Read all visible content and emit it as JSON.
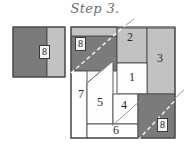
{
  "title": "Step 3.",
  "colors": {
    "dark_gray": "#7b7b7b",
    "light_gray": "#c2c2c2",
    "white": "#fdfdfd",
    "outline": "#4a4a4a",
    "title_text": "#6d6d6d",
    "label_text": "#2a2a2a"
  },
  "left_rectangle": {
    "name": "source-rectangle",
    "x": 13,
    "y": 27,
    "w": 52,
    "h": 50,
    "dark_part": {
      "x": 13,
      "y": 27,
      "w": 34,
      "h": 50,
      "fill": "#7b7b7b"
    },
    "light_part": {
      "x": 47,
      "y": 27,
      "w": 18,
      "h": 50,
      "fill": "#c2c2c2"
    },
    "label": "8",
    "label_x": 41,
    "label_y": 45
  },
  "main_square": {
    "name": "target-square",
    "x": 71,
    "y": 27,
    "w": 104,
    "h": 111
  },
  "pieces": [
    {
      "id": "piece-1",
      "label": "1",
      "fill": "#fdfdfd",
      "x": 117,
      "y": 63,
      "w": 30,
      "h": 31,
      "label_x": 128,
      "label_y": 72
    },
    {
      "id": "piece-2",
      "label": "2",
      "fill": "#c2c2c2",
      "x": 117,
      "y": 28,
      "w": 30,
      "h": 35,
      "label_x": 128,
      "label_y": 37
    },
    {
      "id": "piece-3",
      "label": "3",
      "fill": "#c2c2c2",
      "x": 147,
      "y": 40,
      "w": 28,
      "h": 54,
      "label_x": 158,
      "label_y": 58
    },
    {
      "id": "piece-4",
      "label": "4",
      "fill": "#fdfdfd",
      "x": 113,
      "y": 94,
      "w": 25,
      "h": 30,
      "label_x": 121,
      "label_y": 101
    },
    {
      "id": "piece-5",
      "label": "5",
      "fill": "#fdfdfd",
      "x": 87,
      "y": 83,
      "w": 26,
      "h": 41,
      "label_x": 96,
      "label_y": 98
    },
    {
      "id": "piece-6",
      "label": "6",
      "fill": "#fdfdfd",
      "x": 87,
      "y": 124,
      "w": 51,
      "h": 14,
      "label_x": 114,
      "label_y": 125
    },
    {
      "id": "piece-7",
      "label": "7",
      "fill": "#fdfdfd",
      "x": 71,
      "y": 71,
      "w": 16,
      "h": 67,
      "label_x": 76,
      "label_y": 92
    },
    {
      "id": "piece-8a",
      "label": "8",
      "fill": "#7b7b7b",
      "x": 71,
      "y": 36,
      "w": 46,
      "h": 35,
      "label_x": 77,
      "label_y": 37
    },
    {
      "id": "piece-8b",
      "label": "8",
      "fill": "#7b7b7b",
      "x": 138,
      "y": 94,
      "w": 37,
      "h": 44,
      "label_x": 159,
      "label_y": 118
    }
  ],
  "diagonals": [
    {
      "name": "diagonal-upper-left",
      "x1": 71,
      "y1": 73,
      "x2": 128,
      "y2": 24
    },
    {
      "name": "diagonal-middle",
      "x1": 87,
      "y1": 83,
      "x2": 117,
      "y2": 57
    },
    {
      "name": "diagonal-lower",
      "x1": 113,
      "y1": 124,
      "x2": 140,
      "y2": 98
    },
    {
      "name": "diagonal-lower-right",
      "x1": 138,
      "y1": 138,
      "x2": 182,
      "y2": 92
    }
  ],
  "boxed_markers": [
    {
      "name": "marker-8-top-left",
      "label": "8",
      "x": 76,
      "y": 37
    },
    {
      "name": "marker-8-bottom-right",
      "label": "8",
      "x": 158,
      "y": 119
    }
  ]
}
